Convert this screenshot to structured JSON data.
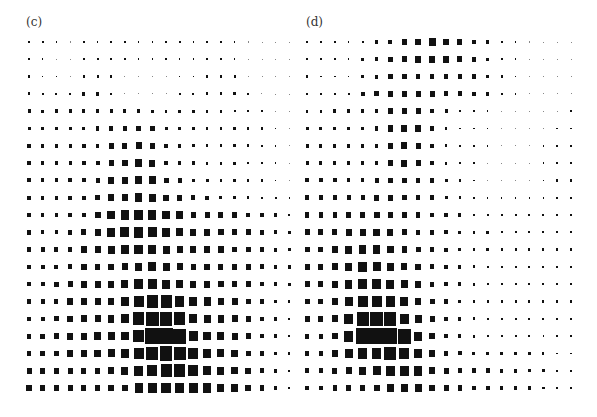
{
  "figure": {
    "panels": [
      {
        "id": "c",
        "label": "(c)",
        "origin_x": 29,
        "origin_y": 42,
        "pitch_x": 13.7,
        "pitch_y": 17.3,
        "offset_left": 0,
        "sizes": [
          [
            2,
            2,
            1.5,
            1,
            1.5,
            1.5,
            1.5,
            1.5,
            1.5,
            1.5,
            1.5,
            2,
            1.5,
            1.5,
            1.5,
            1.5,
            1,
            0.5,
            0.5,
            0.5
          ],
          [
            2,
            1.5,
            1,
            1,
            2,
            2,
            2,
            1.5,
            1.5,
            1.5,
            1.5,
            1.5,
            1.5,
            1.5,
            1.5,
            1.5,
            1,
            0.5,
            0.5,
            0.5
          ],
          [
            2,
            1.5,
            1.5,
            1,
            2,
            2,
            2,
            1,
            1,
            1,
            1,
            1.5,
            1.5,
            2,
            2,
            2,
            1,
            0.5,
            0.5,
            0.5
          ],
          [
            2.5,
            2,
            2,
            2,
            3,
            3,
            1.5,
            1,
            1,
            1,
            1,
            2,
            2,
            2.5,
            2.5,
            2.5,
            1.5,
            1,
            0.5,
            0.5
          ],
          [
            3,
            2.5,
            3,
            3,
            3,
            3,
            3,
            3,
            3,
            2.5,
            2.5,
            2.5,
            2.5,
            2.5,
            2.5,
            2,
            2,
            1.5,
            1,
            0.5
          ],
          [
            3,
            3,
            3,
            3,
            3,
            3.5,
            4.5,
            4.5,
            5,
            5,
            3,
            3,
            2.5,
            2.5,
            2.5,
            2.5,
            2.5,
            2,
            1.5,
            1
          ],
          [
            3.5,
            3,
            3,
            3,
            3.5,
            3.5,
            5,
            5,
            6,
            5.5,
            3.5,
            3,
            2.5,
            2.5,
            2.5,
            2.5,
            2.5,
            2,
            1.5,
            1
          ],
          [
            3.5,
            3,
            3.5,
            3,
            3.5,
            4,
            5,
            5.5,
            6.5,
            6,
            4,
            3.5,
            3,
            2.5,
            2.5,
            2.5,
            2,
            2,
            1.5,
            1
          ],
          [
            3.5,
            3.5,
            3.5,
            3.5,
            3.5,
            4,
            6,
            6,
            7,
            7,
            5,
            4,
            3,
            3,
            2.5,
            2.5,
            2,
            2,
            1.5,
            1
          ],
          [
            3.5,
            3.5,
            3.5,
            3.5,
            3.5,
            4.5,
            6,
            6.5,
            7.5,
            7,
            5.5,
            5,
            4,
            3.5,
            3,
            3,
            2.5,
            2,
            2,
            1.5
          ],
          [
            4,
            3.5,
            3.5,
            4,
            4,
            6,
            7.5,
            8.5,
            9,
            8,
            7.5,
            7,
            5.5,
            5,
            5,
            4.5,
            4,
            3.5,
            3,
            2
          ],
          [
            4,
            3.5,
            3.5,
            4,
            5,
            6,
            7.5,
            9,
            9.5,
            9,
            8,
            7,
            6,
            6,
            5.5,
            5,
            5,
            4,
            3.5,
            2.5
          ],
          [
            4,
            4,
            4,
            4.5,
            6,
            6,
            7,
            8,
            8.5,
            8,
            7,
            6,
            6,
            6,
            5.5,
            5,
            5,
            4.5,
            3.5,
            3
          ],
          [
            4,
            4,
            4,
            4.5,
            5.5,
            5.5,
            5.5,
            6,
            7.5,
            8,
            7,
            6,
            5.5,
            5.5,
            5,
            5,
            5,
            4.5,
            3.5,
            3
          ],
          [
            4,
            4,
            4.5,
            5,
            6,
            6,
            6,
            7,
            9,
            9,
            8,
            7,
            6,
            6,
            5.5,
            5.5,
            5,
            4,
            3,
            2.5
          ],
          [
            4,
            4,
            4,
            5.5,
            6,
            6,
            6.5,
            7.5,
            10,
            11,
            11,
            9,
            8,
            7,
            6.5,
            6,
            5,
            4,
            3,
            2
          ],
          [
            4,
            4,
            4.5,
            5.5,
            6,
            6,
            6.5,
            7.5,
            11,
            12.5,
            12.5,
            11,
            8,
            7,
            6.5,
            6,
            5,
            4,
            3,
            2
          ],
          [
            4.5,
            4.5,
            5,
            6,
            6,
            6.5,
            7,
            7.5,
            11,
            13.7,
            13.7,
            13,
            9,
            7.5,
            7,
            6,
            5,
            4,
            3,
            2
          ],
          [
            4.5,
            4.5,
            5,
            5.5,
            6,
            6.5,
            7,
            7.5,
            10,
            12,
            12.5,
            12,
            10,
            8,
            7,
            6.5,
            5,
            4,
            3,
            2
          ],
          [
            5,
            5,
            5,
            5,
            5,
            5,
            6,
            7,
            9,
            10,
            11,
            11,
            10,
            8,
            7,
            6.5,
            5.5,
            4.5,
            3.5,
            2
          ],
          [
            5.5,
            5.5,
            5.5,
            5,
            5,
            5,
            5.5,
            6,
            8,
            9,
            9.5,
            9.5,
            9,
            8,
            7,
            6.5,
            5.5,
            4.5,
            3.5,
            2
          ]
        ]
      },
      {
        "id": "d",
        "label": "(d)",
        "origin_x": 9,
        "origin_y": 42,
        "pitch_x": 13.9,
        "pitch_y": 17.3,
        "offset_left": 298,
        "sizes": [
          [
            1.5,
            1.5,
            1.5,
            1.5,
            2,
            3,
            4,
            5,
            6,
            7,
            6,
            5,
            4,
            3,
            2,
            1.5,
            1,
            0.5,
            0.5,
            0.5
          ],
          [
            1.5,
            1.5,
            1.5,
            1.5,
            2.5,
            3.5,
            4.5,
            5,
            6,
            6.5,
            6,
            5,
            4,
            3,
            2,
            1.5,
            1,
            0.5,
            0.5,
            0.5
          ],
          [
            2,
            1.5,
            1.5,
            1.5,
            3,
            3.5,
            4.5,
            4.5,
            4.5,
            4.5,
            4.5,
            4.5,
            4,
            3,
            2,
            1.5,
            1,
            0.5,
            0.5,
            0.5
          ],
          [
            2,
            2,
            2,
            2,
            4,
            4.5,
            5,
            5,
            5,
            5,
            4.5,
            4.5,
            3.5,
            3,
            2,
            1.5,
            1,
            1,
            1,
            1
          ],
          [
            2.5,
            2.5,
            3,
            3,
            3,
            3.5,
            5,
            5.5,
            5,
            4,
            3,
            2,
            1.5,
            1.5,
            1,
            1,
            1,
            1,
            1,
            1.5
          ],
          [
            3,
            3,
            3,
            3,
            3,
            3.5,
            5.5,
            6,
            6,
            4,
            2.5,
            1.5,
            1.5,
            1.5,
            1,
            1,
            1,
            1,
            1.5,
            1.5
          ],
          [
            3,
            3,
            3,
            3,
            3,
            3.5,
            5,
            6,
            5,
            3.5,
            2.5,
            1.5,
            1.5,
            1.5,
            1,
            1,
            1,
            1.5,
            1.5,
            1.5
          ],
          [
            3,
            3,
            3,
            3,
            3,
            3.5,
            5,
            6,
            5,
            4,
            2.5,
            1.5,
            1.5,
            1,
            1,
            1,
            1,
            1.5,
            2,
            2
          ],
          [
            3.5,
            3.5,
            3.5,
            3.5,
            3.5,
            4,
            4.5,
            4.5,
            4.5,
            4,
            3,
            2,
            1.5,
            1,
            1,
            1,
            1,
            1.5,
            2,
            2
          ],
          [
            4,
            4,
            4,
            4,
            4,
            5,
            5,
            4.5,
            4.5,
            4,
            3,
            2.5,
            2,
            1.5,
            1.5,
            1.5,
            1.5,
            1.5,
            2,
            2
          ],
          [
            4.5,
            4.5,
            4.5,
            5,
            5.5,
            6,
            5.5,
            5,
            4.5,
            4,
            3.5,
            3,
            2.5,
            2,
            2,
            2,
            2,
            2,
            2,
            2
          ],
          [
            5,
            5,
            5,
            6,
            6,
            6.5,
            6,
            5,
            4.5,
            4,
            3.5,
            3,
            2.5,
            2.5,
            2,
            2,
            2,
            2,
            2,
            2
          ],
          [
            5,
            5,
            5.5,
            7,
            7.5,
            7.5,
            6.5,
            5.5,
            5,
            4.5,
            3.5,
            3,
            2.5,
            2.5,
            2,
            2,
            2,
            2,
            2,
            2
          ],
          [
            5,
            5,
            6,
            7.5,
            8.5,
            8,
            7,
            6,
            5.5,
            4.5,
            3.5,
            3,
            2.5,
            2,
            2,
            2,
            2,
            2,
            2,
            2
          ],
          [
            5,
            5,
            6,
            7.5,
            9,
            8.5,
            8,
            7,
            6,
            4.5,
            3.5,
            3,
            2.5,
            2,
            2,
            2,
            2,
            2,
            2,
            2
          ],
          [
            5,
            5,
            6,
            8,
            10,
            10,
            9,
            8,
            6.5,
            5,
            4,
            3,
            2.5,
            2,
            2,
            2,
            2,
            2,
            2,
            2
          ],
          [
            5,
            5,
            6,
            9,
            12,
            12.5,
            12,
            9,
            7,
            5,
            4,
            3,
            2.5,
            2,
            2,
            2,
            2,
            2,
            2,
            2
          ],
          [
            4.5,
            4.5,
            5.5,
            9.5,
            13.9,
            13.9,
            13.9,
            13,
            8,
            5.5,
            4,
            3,
            2.5,
            2,
            2,
            2,
            2,
            1.5,
            1.5,
            1.5
          ],
          [
            4.5,
            4.5,
            5.5,
            8,
            9.5,
            9.5,
            12,
            10,
            8,
            6,
            4.5,
            3.5,
            3,
            3,
            3,
            3,
            2.5,
            2,
            1.5,
            1.5
          ],
          [
            4,
            4,
            5,
            6,
            7,
            8,
            9,
            9,
            8.5,
            6.5,
            5,
            4.5,
            4,
            4,
            3.5,
            3.5,
            3,
            2.5,
            2,
            1.5
          ],
          [
            4,
            4,
            4.5,
            5,
            5.5,
            6,
            6.5,
            7,
            7,
            6,
            5,
            4.5,
            4,
            4,
            3.5,
            3.5,
            3,
            2.5,
            2,
            2
          ]
        ]
      }
    ],
    "square_color": "#111111",
    "background_color": "#ffffff"
  }
}
